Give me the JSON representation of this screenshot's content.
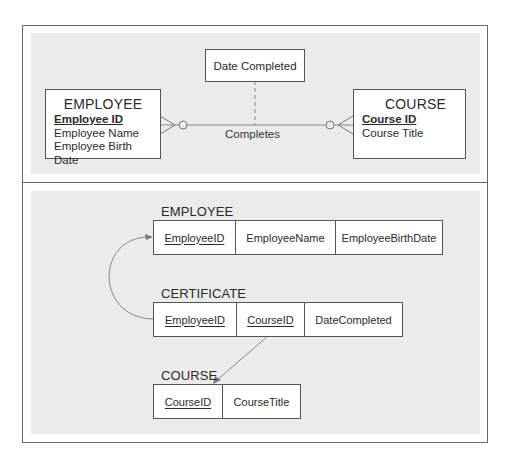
{
  "er_diagram": {
    "relationship_attribute": "Date Completed",
    "relationship_label": "Completes",
    "entities": [
      {
        "name": "EMPLOYEE",
        "primary_key": "Employee ID",
        "attributes": [
          "Employee Name",
          "Employee Birth Date"
        ]
      },
      {
        "name": "COURSE",
        "primary_key": "Course ID",
        "attributes": [
          "Course Title"
        ]
      }
    ],
    "cardinality": {
      "employee_side": "zero-or-many",
      "course_side": "zero-or-many"
    }
  },
  "relational_schema": {
    "tables": [
      {
        "name": "EMPLOYEE",
        "columns": [
          {
            "label": "EmployeeID",
            "pk": true
          },
          {
            "label": "EmployeeName",
            "pk": false
          },
          {
            "label": "EmployeeBirthDate",
            "pk": false
          }
        ]
      },
      {
        "name": "CERTIFICATE",
        "columns": [
          {
            "label": "EmployeeID",
            "pk": true
          },
          {
            "label": "CourseID",
            "pk": true
          },
          {
            "label": "DateCompleted",
            "pk": false
          }
        ]
      },
      {
        "name": "COURSE",
        "columns": [
          {
            "label": "CourseID",
            "pk": true
          },
          {
            "label": "CourseTitle",
            "pk": false
          }
        ]
      }
    ],
    "foreign_keys": [
      {
        "from": "CERTIFICATE.EmployeeID",
        "to": "EMPLOYEE.EmployeeID"
      },
      {
        "from": "CERTIFICATE.CourseID",
        "to": "COURSE.CourseID"
      }
    ]
  },
  "colors": {
    "panel": "#ebebeb",
    "border": "#555555",
    "line": "#777777"
  }
}
